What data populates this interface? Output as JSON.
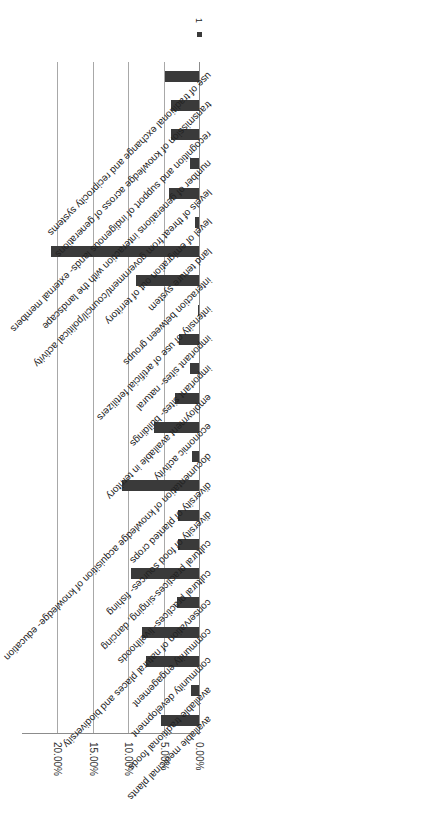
{
  "chart_data": {
    "type": "bar",
    "orientation": "rotated 90deg (horizontal bars, page turned)",
    "title": "",
    "xlabel": "",
    "ylabel": "",
    "ylim": [
      0,
      0.2
    ],
    "tick_labels": [
      "0.00%",
      "5.00%",
      "10.00%",
      "15.00%",
      "20.00%"
    ],
    "grid": true,
    "legend": {
      "entries": [
        "1"
      ],
      "position": "top-right (rotated)"
    },
    "categories": [
      "available medicinal plants",
      "available traditional foods",
      "community development",
      "community engagement",
      "conservation of natural places and biodiversity",
      "cultural practices- livelihoods",
      "cultural practices-singing, dancing",
      "diversity of food sources- fishing",
      "diversity of planted crops",
      "documentation of knowledge acquisition of knowledge- education",
      "economic activity",
      "employment available in territory",
      "important sites- buildings",
      "important sites- natural",
      "intensity of use of artificial fertilizers",
      "interaction between groups",
      "land tenure system",
      "level of emigration out of territory",
      "levels of threat from government/council/political activity",
      "number of generations interaction with the landscape",
      "recognition and support of indigenous lands- external members",
      "transmission of knowledge across of generations",
      "use of traditional exchange and reciprocity systems"
    ],
    "series": [
      {
        "name": "1",
        "values": [
          0.053,
          0.011,
          0.075,
          0.08,
          0.031,
          0.096,
          0.03,
          0.029,
          0.108,
          0.01,
          0.063,
          0.034,
          0.012,
          0.028,
          0.002,
          0.089,
          0.209,
          0.005,
          0.042,
          0.013,
          0.039,
          0.039,
          0.048
        ]
      }
    ],
    "bar_color": "#3a3a3a"
  }
}
